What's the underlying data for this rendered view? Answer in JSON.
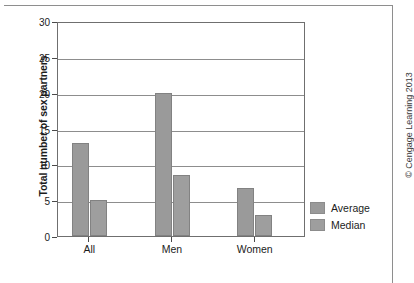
{
  "credit": "© Cengage Learning 2013",
  "legend": {
    "items": [
      {
        "label": "Average",
        "color": "#9a9a9a"
      },
      {
        "label": "Median",
        "color": "#9e9e9e"
      }
    ]
  },
  "chart_data": {
    "type": "bar",
    "title": "",
    "xlabel": "",
    "ylabel": "Total number of sex partners",
    "categories": [
      "All",
      "Men",
      "Women"
    ],
    "series": [
      {
        "name": "Average",
        "values": [
          13,
          20,
          6.7
        ],
        "color": "#9a9a9a"
      },
      {
        "name": "Median",
        "values": [
          5,
          8.5,
          3
        ],
        "color": "#9e9e9e"
      }
    ],
    "ylim": [
      0,
      30
    ],
    "yticks": [
      0,
      5,
      10,
      15,
      20,
      25,
      30
    ],
    "ytick_labels": [
      "0",
      "5",
      "10",
      "15",
      "20",
      "25",
      "30"
    ],
    "grid": "horizontal",
    "legend_position": "right"
  }
}
